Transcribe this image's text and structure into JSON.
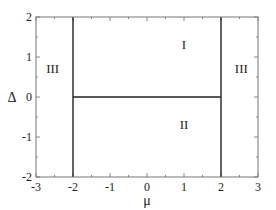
{
  "chart_data": {
    "type": "line",
    "title": "",
    "xlabel": "μ",
    "ylabel": "Δ",
    "xlim": [
      -3,
      3
    ],
    "ylim": [
      -2,
      2
    ],
    "grid": false,
    "x_ticks": [
      -3,
      -2,
      -1,
      0,
      1,
      2,
      3
    ],
    "y_ticks": [
      -2,
      -1,
      0,
      1,
      2
    ],
    "x_tick_labels": [
      "-3",
      "-2",
      "-1",
      "0",
      "1",
      "2",
      "3"
    ],
    "y_tick_labels": [
      "-2",
      "-1",
      "0",
      "1",
      "2"
    ],
    "series": [
      {
        "name": "boundary-mu-minus-2",
        "x": [
          -2,
          -2
        ],
        "y": [
          -2,
          2
        ]
      },
      {
        "name": "boundary-mu-plus-2",
        "x": [
          2,
          2
        ],
        "y": [
          -2,
          2
        ]
      },
      {
        "name": "boundary-delta-0",
        "x": [
          -2,
          2
        ],
        "y": [
          0,
          0
        ]
      }
    ],
    "annotations": [
      {
        "text": "I",
        "x": 1.0,
        "y": 1.3
      },
      {
        "text": "II",
        "x": 1.0,
        "y": -0.7
      },
      {
        "text": "III",
        "x": -2.55,
        "y": 0.7
      },
      {
        "text": "III",
        "x": 2.55,
        "y": 0.7
      }
    ]
  }
}
